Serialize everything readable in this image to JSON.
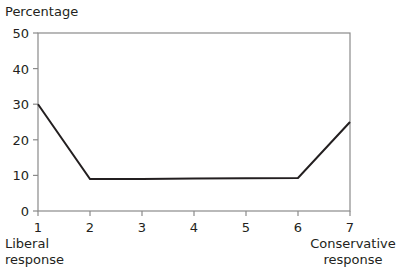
{
  "chart_data": {
    "type": "line",
    "title": "",
    "ylabel": "Percentage",
    "xlabel": "",
    "x": [
      1,
      2,
      3,
      4,
      5,
      6,
      7
    ],
    "x_tick_labels": [
      "1",
      "2",
      "3",
      "4",
      "5",
      "6",
      "7"
    ],
    "x_end_labels": {
      "left": [
        "Liberal",
        "response"
      ],
      "right": [
        "Conservative",
        "response"
      ]
    },
    "series": [
      {
        "name": "Response distribution",
        "values": [
          30,
          9,
          9,
          9.1,
          9.2,
          9.3,
          25
        ]
      }
    ],
    "ylim": [
      0,
      50
    ],
    "xlim": [
      1,
      7
    ],
    "y_ticks": [
      0,
      10,
      20,
      30,
      40,
      50
    ],
    "grid": false,
    "legend": "none",
    "frame": "box"
  },
  "colors": {
    "line": "#231f20",
    "axis": "#8a8a8a",
    "text": "#231f20"
  }
}
